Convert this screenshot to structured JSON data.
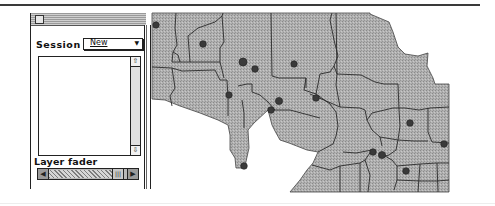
{
  "palette": {
    "session_label": "Session",
    "session_value": "New",
    "session_arrow": "▼",
    "layer_fader_label": "Layer fader",
    "scroll_up_glyph": "⇧",
    "scroll_down_glyph": "⇩",
    "fader_left_glyph": "◀",
    "fader_right_glyph": "▶",
    "fader_thumb_glyph": "|||"
  },
  "map": {
    "fill_color": "#a9a9a9",
    "border_color": "#333333",
    "dot_color": "#3c3c3c",
    "dots": [
      {
        "x": 156,
        "y": 25
      },
      {
        "x": 203,
        "y": 44
      },
      {
        "x": 243,
        "y": 62
      },
      {
        "x": 255,
        "y": 69
      },
      {
        "x": 294,
        "y": 64
      },
      {
        "x": 229,
        "y": 95
      },
      {
        "x": 279,
        "y": 101
      },
      {
        "x": 271,
        "y": 110
      },
      {
        "x": 316,
        "y": 98
      },
      {
        "x": 244,
        "y": 166
      },
      {
        "x": 410,
        "y": 123
      },
      {
        "x": 444,
        "y": 144
      },
      {
        "x": 373,
        "y": 152
      },
      {
        "x": 382,
        "y": 155
      },
      {
        "x": 406,
        "y": 171
      }
    ]
  }
}
